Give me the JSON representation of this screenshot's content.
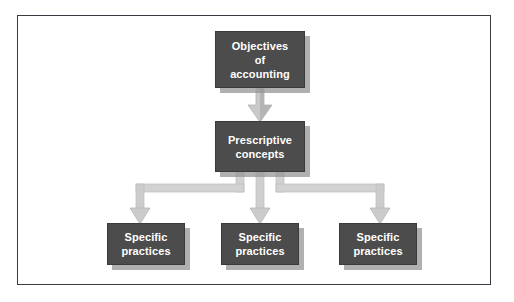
{
  "diagram": {
    "type": "flowchart",
    "orientation": "top-down",
    "title": "",
    "frame": {
      "border_color": "#3b3b44",
      "background_color": "#ffffff"
    },
    "style": {
      "node_fill": "#4c4c4c",
      "node_text_color": "#ffffff",
      "node_border_color": "#3a3a3a",
      "node_shadow_color": "#969696",
      "arrow_light": "#d2d2d2",
      "arrow_mid": "#bdbdbd",
      "arrow_dark": "#a8a8a8"
    },
    "nodes": [
      {
        "id": "objectives",
        "label": "Objectives\nof\naccounting",
        "level": 1
      },
      {
        "id": "prescriptive",
        "label": "Prescriptive\nconcepts",
        "level": 2
      },
      {
        "id": "practice-1",
        "label": "Specific\npractices",
        "level": 3
      },
      {
        "id": "practice-2",
        "label": "Specific\npractices",
        "level": 3
      },
      {
        "id": "practice-3",
        "label": "Specific\npractices",
        "level": 3
      }
    ],
    "edges": [
      {
        "id": "edge-objectives-to-prescriptive",
        "from": "objectives",
        "to": "prescriptive",
        "shape": "straight-down"
      },
      {
        "id": "edge-prescriptive-to-practice-1",
        "from": "prescriptive",
        "to": "practice-1",
        "shape": "elbow-left"
      },
      {
        "id": "edge-prescriptive-to-practice-2",
        "from": "prescriptive",
        "to": "practice-2",
        "shape": "straight-down"
      },
      {
        "id": "edge-prescriptive-to-practice-3",
        "from": "prescriptive",
        "to": "practice-3",
        "shape": "elbow-right"
      }
    ]
  }
}
